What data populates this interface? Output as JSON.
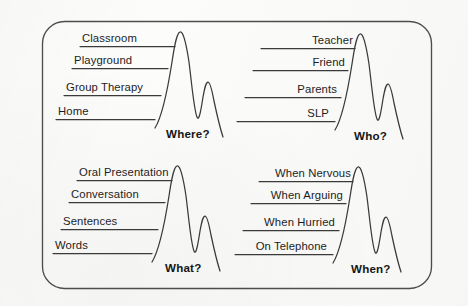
{
  "diagram": {
    "border_color": "#4a4a4a",
    "line_color": "#3a3a3a",
    "text_color": "#1d1d1d",
    "background_color": "#fcfcfb",
    "panels": [
      {
        "id": "where",
        "question": "Where?",
        "align": "left",
        "labels": [
          {
            "text": "Classroom",
            "rank": 4
          },
          {
            "text": "Playground",
            "rank": 3
          },
          {
            "text": "Group Therapy",
            "rank": 2
          },
          {
            "text": "Home",
            "rank": 1
          }
        ]
      },
      {
        "id": "who",
        "question": "Who?",
        "align": "right",
        "labels": [
          {
            "text": "Teacher",
            "rank": 4
          },
          {
            "text": "Friend",
            "rank": 3
          },
          {
            "text": "Parents",
            "rank": 2
          },
          {
            "text": "SLP",
            "rank": 1
          }
        ]
      },
      {
        "id": "what",
        "question": "What?",
        "align": "left",
        "labels": [
          {
            "text": "Oral Presentation",
            "rank": 4
          },
          {
            "text": "Conversation",
            "rank": 3
          },
          {
            "text": "Sentences",
            "rank": 2
          },
          {
            "text": "Words",
            "rank": 1
          }
        ]
      },
      {
        "id": "when",
        "question": "When?",
        "align": "right",
        "labels": [
          {
            "text": "When Nervous",
            "rank": 4
          },
          {
            "text": "When Arguing",
            "rank": 3
          },
          {
            "text": "When Hurried",
            "rank": 2
          },
          {
            "text": "On Telephone",
            "rank": 1
          }
        ]
      }
    ]
  }
}
